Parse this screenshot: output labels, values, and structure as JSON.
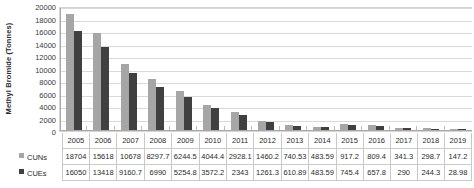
{
  "chart_data": {
    "type": "bar",
    "title": "",
    "xlabel": "",
    "ylabel": "Methyl Bromide (Tonnes)",
    "ylim": [
      0,
      20000
    ],
    "ytick_step": 2000,
    "yticks": [
      "20000",
      "18000",
      "16000",
      "14000",
      "12000",
      "10000",
      "8000",
      "6000",
      "4000",
      "2000",
      "0"
    ],
    "grid": true,
    "legend_position": "data-table",
    "categories": [
      "2005",
      "2006",
      "2007",
      "2008",
      "2009",
      "2010",
      "2011",
      "2012",
      "2013",
      "2014",
      "2015",
      "2016",
      "2017",
      "2018",
      "2019"
    ],
    "series": [
      {
        "name": "CUNs",
        "color": "#a6a6a6",
        "values": [
          18704,
          15618,
          10678,
          8297.7,
          6244.5,
          4044.4,
          2928.1,
          1460.2,
          740.53,
          483.59,
          917.2,
          809.4,
          341.3,
          298.7,
          147.2
        ],
        "labels": [
          "18704",
          "15618",
          "10678",
          "8297.7",
          "6244.5",
          "4044.4",
          "2928.1",
          "1460.2",
          "740.53",
          "483.59",
          "917.2",
          "809.4",
          "341.3",
          "298.7",
          "147.2"
        ]
      },
      {
        "name": "CUEs",
        "color": "#404040",
        "values": [
          16050,
          13418,
          9160.7,
          6990,
          5254.8,
          3572.2,
          2343,
          1261.3,
          610.89,
          483.59,
          745.4,
          657.8,
          290,
          244.3,
          28.98
        ],
        "labels": [
          "16050",
          "13418",
          "9160.7",
          "6990",
          "5254.8",
          "3572.2",
          "2343",
          "1261.3",
          "610.89",
          "483.59",
          "745.4",
          "657.8",
          "290",
          "244.3",
          "28.98"
        ]
      }
    ]
  }
}
